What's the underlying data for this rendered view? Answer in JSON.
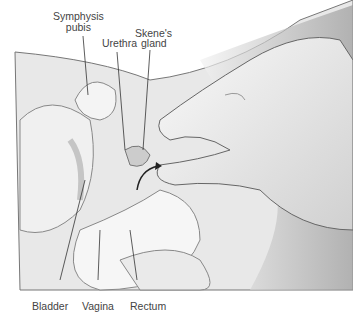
{
  "labels": {
    "symphysis_line1": "Symphysis",
    "symphysis_line2": "pubis",
    "skenes": "Skene's",
    "urethra": "Urethra",
    "gland": "gland",
    "bladder": "Bladder",
    "vagina": "Vagina",
    "rectum": "Rectum"
  }
}
